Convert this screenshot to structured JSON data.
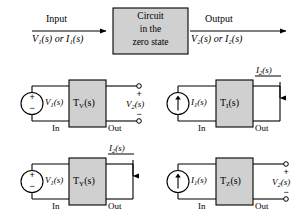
{
  "figure": {
    "title_block": {
      "box_line1": "Circuit",
      "box_line2": "in the",
      "box_line3": "zero state",
      "input_label": "Input",
      "input_vars": "V₁(s) or I₁(s)",
      "output_label": "Output",
      "output_vars": "V₂(s) or I₂(s)"
    },
    "colors": {
      "box_fill": "#d0d0d0",
      "box_stroke": "#000000",
      "wire": "#000000",
      "background": "#ffffff"
    },
    "common": {
      "in_label": "In",
      "out_label": "Out",
      "plus_sign": "+",
      "minus_sign": "−"
    },
    "panels": [
      {
        "id": "tv",
        "source_type": "voltage-source",
        "source_label_main": "V",
        "source_label_sub": "1",
        "source_label_tail": "(s)",
        "block_label_main": "T",
        "block_label_sub": "V",
        "block_label_tail": "(s)",
        "output_type": "open-terminals",
        "output_label_main": "V",
        "output_label_sub": "2",
        "output_label_tail": "(s)",
        "in_label": "In",
        "out_label": "Out"
      },
      {
        "id": "ti",
        "source_type": "current-source",
        "source_label_main": "I",
        "source_label_sub": "1",
        "source_label_tail": "(s)",
        "block_label_main": "T",
        "block_label_sub": "I",
        "block_label_tail": "(s)",
        "output_type": "short-circuit",
        "output_label_main": "I",
        "output_label_sub": "2",
        "output_label_tail": "(s)",
        "in_label": "In",
        "out_label": "Out"
      },
      {
        "id": "ty",
        "source_type": "voltage-source",
        "source_label_main": "V",
        "source_label_sub": "1",
        "source_label_tail": "(s)",
        "block_label_main": "T",
        "block_label_sub": "Y",
        "block_label_tail": "(s)",
        "output_type": "short-circuit",
        "output_label_main": "I",
        "output_label_sub": "2",
        "output_label_tail": "(s)",
        "in_label": "In",
        "out_label": "Out"
      },
      {
        "id": "tz",
        "source_type": "current-source",
        "source_label_main": "I",
        "source_label_sub": "1",
        "source_label_tail": "(s)",
        "block_label_main": "T",
        "block_label_sub": "Z",
        "block_label_tail": "(s)",
        "output_type": "open-terminals",
        "output_label_main": "V",
        "output_label_sub": "2",
        "output_label_tail": "(s)",
        "in_label": "In",
        "out_label": "Out"
      }
    ]
  }
}
